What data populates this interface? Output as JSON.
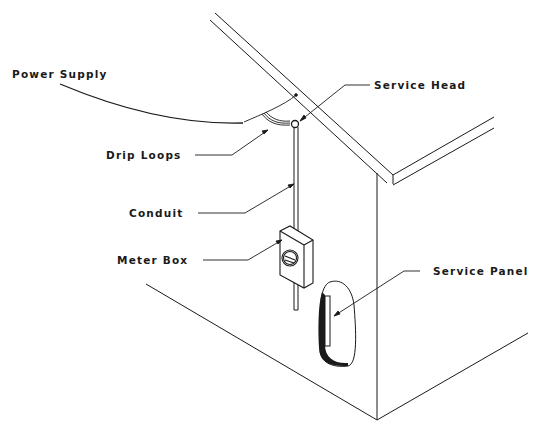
{
  "diagram": {
    "labels": {
      "power_supply": "Power Supply",
      "service_head": "Service Head",
      "drip_loops": "Drip Loops",
      "conduit": "Conduit",
      "meter_box": "Meter Box",
      "service_panel": "Service Panel"
    },
    "colors": {
      "line": "#1a1a1a",
      "background": "#ffffff"
    }
  }
}
